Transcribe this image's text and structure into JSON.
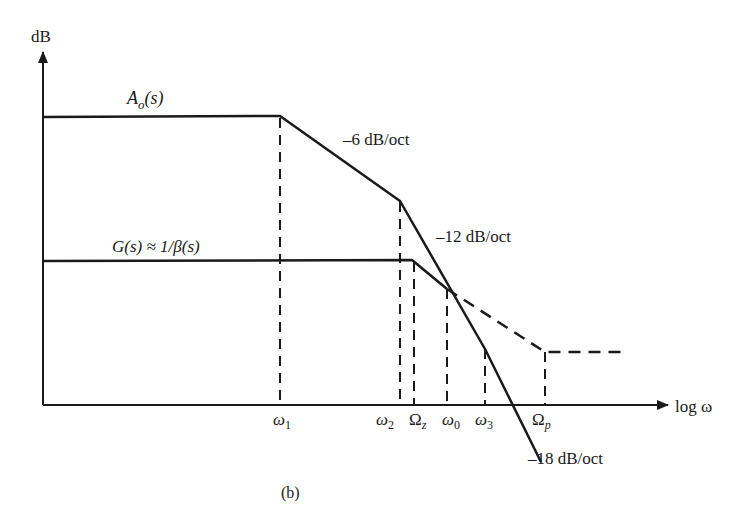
{
  "figure": {
    "caption": "(b)",
    "y_axis_label": "dB",
    "x_axis_label": "log ω",
    "curves": {
      "open_loop": {
        "label": "A",
        "label_sub": "o",
        "label_suffix": "(s)",
        "slopes": [
          "–6 dB/oct",
          "–12 dB/oct",
          "–18 dB/oct"
        ]
      },
      "feedback": {
        "label": "G(s) ≈ 1/β(s)"
      }
    },
    "ticks": [
      {
        "base": "ω",
        "sub": "1"
      },
      {
        "base": "ω",
        "sub": "2"
      },
      {
        "base": "Ω",
        "sub": "z"
      },
      {
        "base": "ω",
        "sub": "0"
      },
      {
        "base": "ω",
        "sub": "3"
      },
      {
        "base": "Ω",
        "sub": "p"
      }
    ]
  }
}
